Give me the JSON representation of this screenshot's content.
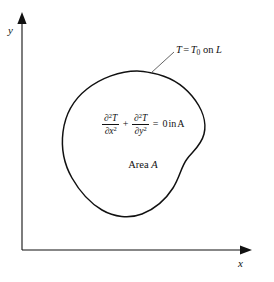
{
  "figure": {
    "type": "diagram",
    "background_color": "#ffffff",
    "line_color": "#111111",
    "axis_color": "#111111"
  },
  "axes": {
    "x_label": "x",
    "y_label": "y",
    "origin": {
      "x": 22,
      "y": 250
    },
    "x_axis_end": {
      "x": 252,
      "y": 250
    },
    "y_axis_end": {
      "x": 22,
      "y": 14
    },
    "arrowheads": [
      "x-axis-right",
      "y-axis-top"
    ]
  },
  "region": {
    "name": "Area A",
    "area_label_prefix": "Area",
    "area_label_symbol": "A",
    "outline_closed": true,
    "bounds": {
      "left": 63,
      "top": 72,
      "right": 207,
      "bottom": 216
    }
  },
  "boundary_condition": {
    "label_T": "T",
    "label_equals": "=",
    "label_T0_base": "T",
    "label_T0_sub": "0",
    "label_on": "on",
    "label_L": "L",
    "leader_line": {
      "from": {
        "x": 152,
        "y": 74
      },
      "to": {
        "x": 176,
        "y": 52
      }
    }
  },
  "equation": {
    "term1": {
      "numerator_partial": "∂",
      "numerator_sup": "2",
      "numerator_var": "T",
      "denominator_partial": "∂",
      "denominator_var": "x",
      "denominator_sup": "2"
    },
    "plus": "+",
    "term2": {
      "numerator_partial": "∂",
      "numerator_sup": "2",
      "numerator_var": "T",
      "denominator_partial": "∂",
      "denominator_var": "y",
      "denominator_sup": "2"
    },
    "equals": "=",
    "rhs": "0",
    "qualifier_in": "in",
    "qualifier_region": "A"
  },
  "caption": {
    "text": ""
  }
}
